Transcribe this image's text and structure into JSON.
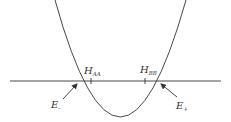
{
  "diagram": {
    "type": "energy-level parabola diagram",
    "colors": {
      "stroke": "#333333",
      "background": "#ffffff"
    },
    "curve": {
      "shape": "parabola",
      "vertex": [
        120,
        117
      ],
      "left_top": [
        55,
        0
      ],
      "right_top": [
        186,
        0
      ]
    },
    "axis": {
      "y": 81,
      "x_start": 10,
      "x_end": 221
    },
    "ticks": [
      {
        "name": "H_AA",
        "x": 91
      },
      {
        "name": "H_BB",
        "x": 145
      }
    ],
    "labels": {
      "h_aa": {
        "main": "H",
        "sub": "AA"
      },
      "h_bb": {
        "main": "H",
        "sub": "BB"
      },
      "e_minus": {
        "main": "E",
        "sub": "-"
      },
      "e_plus": {
        "main": "E",
        "sub": "+"
      }
    },
    "arrows": [
      {
        "name": "E-",
        "from": [
          63,
          99
        ],
        "to": [
          77,
          84
        ]
      },
      {
        "name": "E+",
        "from": [
          177,
          97
        ],
        "to": [
          161,
          84
        ]
      }
    ]
  }
}
